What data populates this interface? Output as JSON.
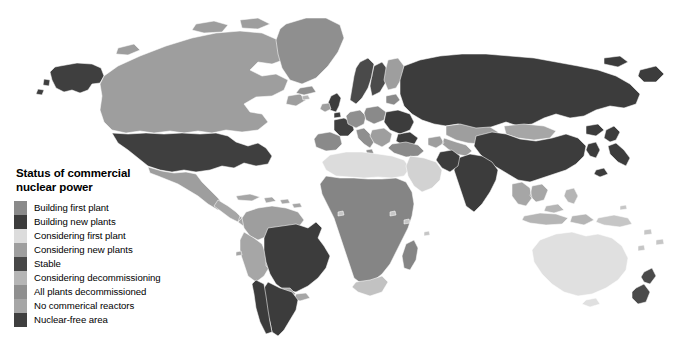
{
  "page": {
    "width": 677,
    "height": 341,
    "background": "#ffffff",
    "corner_mark_color": "#8d8d8d"
  },
  "legend": {
    "title": "Status of commercial\nnuclear power",
    "items": [
      {
        "label": "Building first plant",
        "color": "#8a8a8a"
      },
      {
        "label": "Building new plants",
        "color": "#3c3c3c"
      },
      {
        "label": "Considering first plant",
        "color": "#dcdcdc"
      },
      {
        "label": "Considering new plants",
        "color": "#9e9e9e"
      },
      {
        "label": "Stable",
        "color": "#474747"
      },
      {
        "label": "Considering decommissioning",
        "color": "#b5b5b5"
      },
      {
        "label": "All plants decommissioned",
        "color": "#8f8f8f"
      },
      {
        "label": "No commerical reactors",
        "color": "#a6a6a6"
      },
      {
        "label": "Nuclear-free area",
        "color": "#3f3f3f"
      }
    ]
  },
  "map": {
    "ocean_color": "#ffffff",
    "border_color": "#ffffff",
    "regions": [
      {
        "name": "alaska",
        "status": "Stable",
        "color": "#3f3f3f"
      },
      {
        "name": "canada",
        "status": "Considering new plants",
        "color": "#9e9e9e"
      },
      {
        "name": "greenland",
        "status": "No commerical reactors",
        "color": "#8f8f8f"
      },
      {
        "name": "united-states",
        "status": "Stable",
        "color": "#3f3f3f"
      },
      {
        "name": "mexico",
        "status": "Considering new plants",
        "color": "#9e9e9e"
      },
      {
        "name": "central-america",
        "status": "No commerical reactors",
        "color": "#a6a6a6"
      },
      {
        "name": "caribbean",
        "status": "No commerical reactors",
        "color": "#a6a6a6"
      },
      {
        "name": "colombia-venezuela",
        "status": "Considering new plants",
        "color": "#9e9e9e"
      },
      {
        "name": "peru-bolivia",
        "status": "No commerical reactors",
        "color": "#a6a6a6"
      },
      {
        "name": "brazil",
        "status": "Building new plants",
        "color": "#3c3c3c"
      },
      {
        "name": "argentina",
        "status": "Building new plants",
        "color": "#3c3c3c"
      },
      {
        "name": "chile",
        "status": "Building new plants",
        "color": "#3c3c3c"
      },
      {
        "name": "paraguay-uruguay",
        "status": "No commerical reactors",
        "color": "#a6a6a6"
      },
      {
        "name": "north-africa",
        "status": "Considering first plant",
        "color": "#dcdcdc"
      },
      {
        "name": "sub-saharan-africa",
        "status": "No commerical reactors",
        "color": "#858585"
      },
      {
        "name": "south-africa",
        "status": "Considering new plants",
        "color": "#c2c2c2"
      },
      {
        "name": "madagascar",
        "status": "No commerical reactors",
        "color": "#858585"
      },
      {
        "name": "middle-east",
        "status": "Considering first plant",
        "color": "#d2d2d2"
      },
      {
        "name": "turkey",
        "status": "Building first plant",
        "color": "#8a8a8a"
      },
      {
        "name": "united-kingdom",
        "status": "Building new plants",
        "color": "#3c3c3c"
      },
      {
        "name": "ireland",
        "status": "Nuclear-free area",
        "color": "#9e9e9e"
      },
      {
        "name": "france",
        "status": "Stable",
        "color": "#3f3f3f"
      },
      {
        "name": "spain-portugal",
        "status": "Considering decommissioning",
        "color": "#8a8a8a"
      },
      {
        "name": "germany",
        "status": "All plants decommissioned",
        "color": "#8f8f8f"
      },
      {
        "name": "scandinavia",
        "status": "Stable",
        "color": "#4a4a4a"
      },
      {
        "name": "poland-baltics",
        "status": "Building first plant",
        "color": "#8a8a8a"
      },
      {
        "name": "eastern-europe",
        "status": "Building new plants",
        "color": "#3c3c3c"
      },
      {
        "name": "italy",
        "status": "All plants decommissioned",
        "color": "#8f8f8f"
      },
      {
        "name": "balkans",
        "status": "No commerical reactors",
        "color": "#9e9e9e"
      },
      {
        "name": "russia",
        "status": "Building new plants",
        "color": "#3c3c3c"
      },
      {
        "name": "kazakhstan",
        "status": "Considering new plants",
        "color": "#9e9e9e"
      },
      {
        "name": "central-asia",
        "status": "No commerical reactors",
        "color": "#9e9e9e"
      },
      {
        "name": "mongolia",
        "status": "No commerical reactors",
        "color": "#a6a6a6"
      },
      {
        "name": "china",
        "status": "Building new plants",
        "color": "#3c3c3c"
      },
      {
        "name": "india",
        "status": "Building new plants",
        "color": "#3c3c3c"
      },
      {
        "name": "pakistan",
        "status": "Building new plants",
        "color": "#3c3c3c"
      },
      {
        "name": "japan",
        "status": "Building new plants",
        "color": "#3c3c3c"
      },
      {
        "name": "korea",
        "status": "Building new plants",
        "color": "#3c3c3c"
      },
      {
        "name": "southeast-asia",
        "status": "Considering first plant",
        "color": "#a6a6a6"
      },
      {
        "name": "indonesia",
        "status": "Considering first plant",
        "color": "#b5b5b5"
      },
      {
        "name": "philippines",
        "status": "Considering first plant",
        "color": "#b5b5b5"
      },
      {
        "name": "australia",
        "status": "Nuclear-free area",
        "color": "#e0e0e0"
      },
      {
        "name": "new-zealand",
        "status": "Nuclear-free area",
        "color": "#4a4a4a"
      },
      {
        "name": "papua-new-guinea",
        "status": "No commerical reactors",
        "color": "#c6c6c6"
      }
    ]
  }
}
